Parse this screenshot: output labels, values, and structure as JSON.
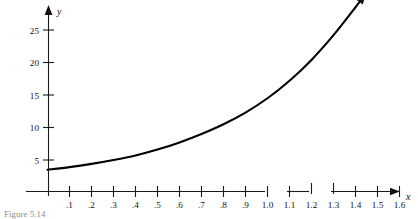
{
  "figure": {
    "caption_partial": "Figure 5.14",
    "y_axis_title": "y",
    "x_axis_title": "x"
  },
  "chart_data": {
    "type": "line",
    "title": "",
    "xlabel": "x",
    "ylabel": "y",
    "xlim": [
      0,
      1.7
    ],
    "ylim": [
      0,
      27
    ],
    "grid": false,
    "legend": false,
    "x_ticks": [
      0.1,
      0.2,
      0.3,
      0.4,
      0.5,
      0.6,
      0.7,
      0.8,
      0.9,
      1.0,
      1.1,
      1.2,
      1.3,
      1.4,
      1.5,
      1.6
    ],
    "x_tick_labels": [
      ".1",
      ".2",
      ".3",
      ".4",
      ".5",
      ".6",
      ".7",
      ".8",
      ".9",
      "1.0",
      "1.1",
      "1.2",
      "1.3",
      "1.4",
      "1.5",
      "1.6"
    ],
    "y_ticks": [
      5,
      10,
      15,
      20,
      25
    ],
    "y_tick_labels": [
      "5",
      "10",
      "15",
      "20",
      "25"
    ],
    "series": [
      {
        "name": "exponential-curve",
        "color": "#000000",
        "arrow_end": true,
        "x": [
          0.0,
          0.1,
          0.2,
          0.3,
          0.4,
          0.5,
          0.6,
          0.7,
          0.8,
          0.9,
          1.0,
          1.1,
          1.2,
          1.3,
          1.4,
          1.45
        ],
        "y": [
          3.5,
          3.9,
          4.4,
          5.0,
          5.7,
          6.6,
          7.7,
          9.0,
          10.5,
          12.3,
          14.5,
          17.2,
          20.4,
          24.2,
          28.5,
          30.8
        ]
      }
    ]
  }
}
